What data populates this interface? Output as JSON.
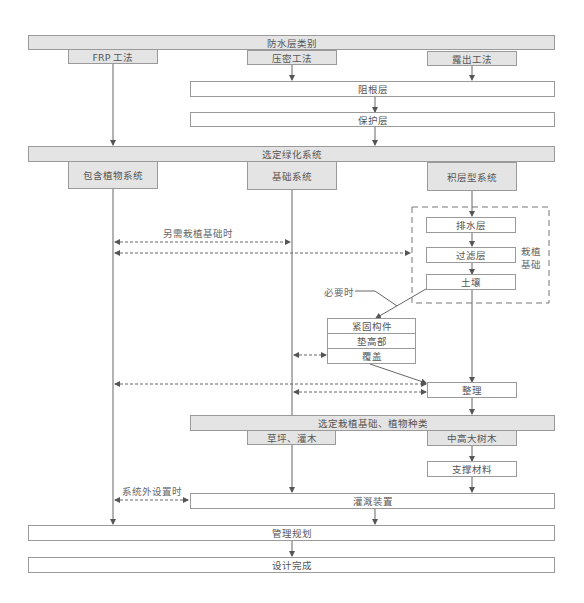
{
  "diagram": {
    "header1": "防水层类别",
    "methods": [
      "FRP 工法",
      "压密工法",
      "露出工法"
    ],
    "root_barrier": "阻根层",
    "protection": "保护层",
    "header2": "选定绿化系统",
    "systems": [
      "包含植物系统",
      "基础系统",
      "积层型系统"
    ],
    "layers": [
      "排水层",
      "过滤层",
      "土壤"
    ],
    "planting_base_label": "栽植\n基础",
    "planting_base_line1": "栽植",
    "planting_base_line2": "基础",
    "note_extra_base": "另需栽植基础时",
    "note_if_needed": "必要时",
    "fixing_group": [
      "紧固构件",
      "垫高部",
      "覆盖"
    ],
    "finish": "整理",
    "header3": "选定栽植基础、植物种类",
    "plant_types": [
      "草坪、灌木",
      "中高大树木"
    ],
    "support": "支撑材料",
    "note_outside": "系统外设置时",
    "irrigation": "灌溉装置",
    "management": "管理规划",
    "done": "设计完成"
  },
  "colors": {
    "header_fill": "#e4e4e4",
    "border": "#9a9a9a",
    "line": "#555555",
    "text": "#555555"
  }
}
